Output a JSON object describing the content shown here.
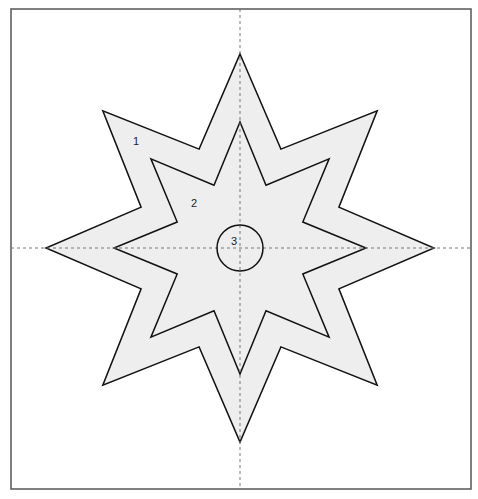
{
  "diagram": {
    "frame": {
      "x": 11,
      "y": 9,
      "width": 460,
      "height": 480,
      "stroke": "#555555"
    },
    "center": {
      "x": 240,
      "y": 248
    },
    "axes": {
      "style": "dashed",
      "color": "#777777"
    },
    "shapes": [
      {
        "id": "1",
        "kind": "eight-point-star",
        "outer_radius": 194,
        "inner_radius": 107,
        "fill": "#eeeeee",
        "stroke": "#111111",
        "label": "1",
        "label_pos": {
          "x": 133,
          "y": 145
        }
      },
      {
        "id": "2",
        "kind": "eight-point-star",
        "outer_radius": 126,
        "inner_radius": 68,
        "fill": "#eeeeee",
        "stroke": "#111111",
        "label": "2",
        "label_pos": {
          "x": 191,
          "y": 207
        }
      },
      {
        "id": "3",
        "kind": "circle",
        "radius": 23,
        "fill": "none",
        "stroke": "#111111",
        "label": "3",
        "label_pos": {
          "x": 231,
          "y": 245
        }
      }
    ]
  }
}
